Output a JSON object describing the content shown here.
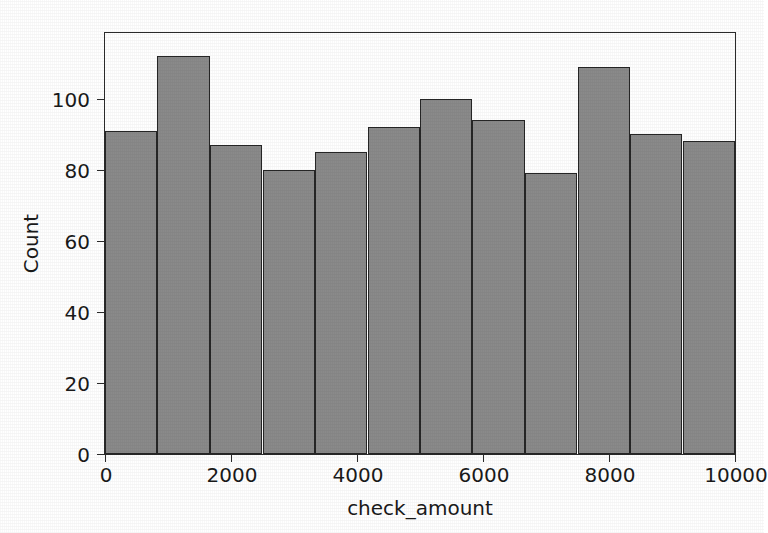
{
  "chart_data": {
    "type": "bar",
    "subtype": "histogram",
    "title": "",
    "xlabel": "check_amount",
    "ylabel": "Count",
    "xlim": [
      0,
      10000
    ],
    "ylim": [
      0,
      118.5
    ],
    "grid": false,
    "legend": null,
    "bin_count": 12,
    "bin_width": 833.33,
    "bin_edges": [
      0,
      833.33,
      1666.67,
      2500,
      3333.33,
      4166.67,
      5000,
      5833.33,
      6666.67,
      7500,
      8333.33,
      9166.67,
      10000
    ],
    "categories": [
      "0-833",
      "833-1667",
      "1667-2500",
      "2500-3333",
      "3333-4167",
      "4167-5000",
      "5000-5833",
      "5833-6667",
      "6667-7500",
      "7500-8333",
      "8333-9167",
      "9167-10000"
    ],
    "values": [
      91,
      112,
      87,
      80,
      85,
      92,
      100,
      94,
      79,
      109,
      90,
      88
    ],
    "bar_color": "#8a8a8a",
    "bar_edge_color": "#262626",
    "xticks": [
      {
        "value": 0,
        "label": "0"
      },
      {
        "value": 2000,
        "label": "2000"
      },
      {
        "value": 4000,
        "label": "4000"
      },
      {
        "value": 6000,
        "label": "6000"
      },
      {
        "value": 8000,
        "label": "8000"
      },
      {
        "value": 10000,
        "label": "10000"
      }
    ],
    "yticks": [
      {
        "value": 0,
        "label": "0"
      },
      {
        "value": 20,
        "label": "20"
      },
      {
        "value": 40,
        "label": "40"
      },
      {
        "value": 60,
        "label": "60"
      },
      {
        "value": 80,
        "label": "80"
      },
      {
        "value": 100,
        "label": "100"
      }
    ]
  },
  "figure": {
    "background_color": "#ffffff",
    "axes_edge_color": "#2b2b2b",
    "text_color": "#1a1a1a"
  }
}
